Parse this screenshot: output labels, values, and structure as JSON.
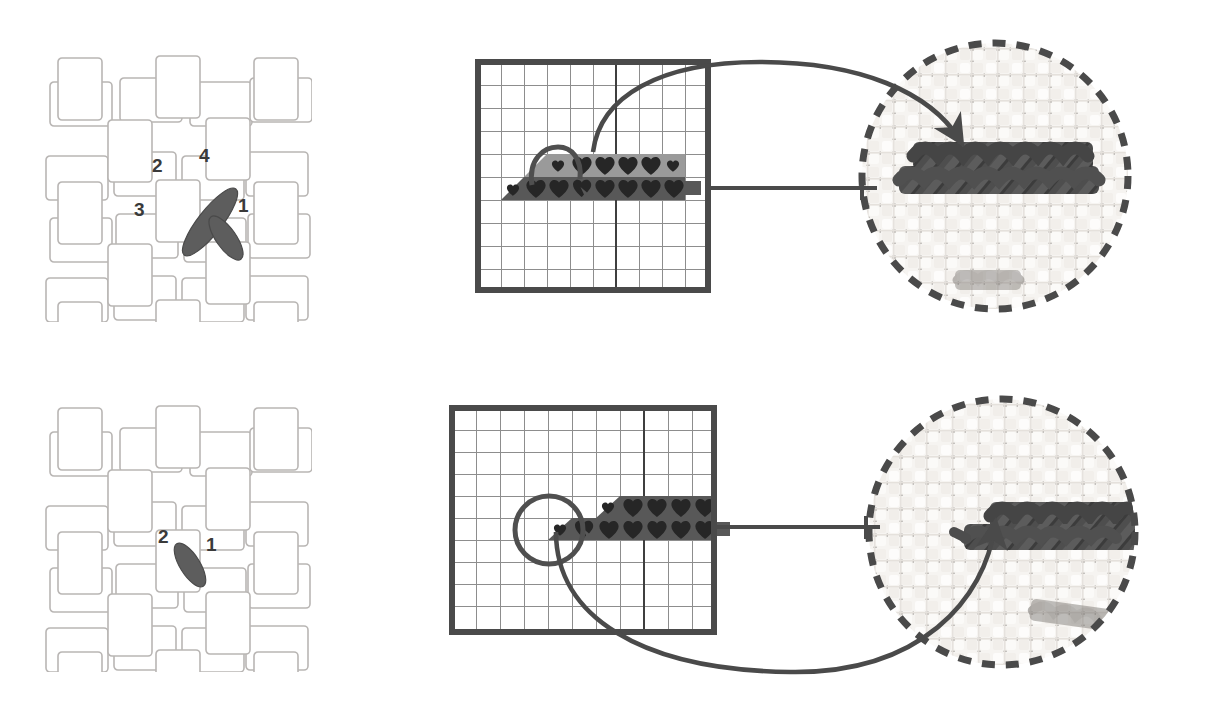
{
  "figure": {
    "background_color": "#ffffff",
    "ink_color": "#4a4a4a",
    "dark_fill": "#555555",
    "light_fill": "#9a9a9a",
    "symbol_color": "#2b2b2b"
  },
  "panels": [
    {
      "id": "full-cross-stitch",
      "row": "top",
      "weave_diagram": {
        "name": "full-cross-stitch-weave",
        "stitch_type": "full cross stitch",
        "needle_points": 4,
        "labels": [
          {
            "text": "1",
            "x": 198,
            "y": 198
          },
          {
            "text": "2",
            "x": 152,
            "y": 163
          },
          {
            "text": "3",
            "x": 138,
            "y": 205
          },
          {
            "text": "4",
            "x": 196,
            "y": 150
          }
        ],
        "strokes": [
          {
            "from": "3",
            "to": "4",
            "kind": "long-diagonal"
          },
          {
            "from": "1",
            "to": "2",
            "kind": "short-diagonal"
          }
        ]
      },
      "chart": {
        "name": "full-cross-stitch-chart",
        "columns": 10,
        "rows": 10,
        "heavy_vertical_gridline_column": 6,
        "band_rows": [
          {
            "row_index": 4,
            "fill": "light",
            "left_ramp": true,
            "right_ramp": true,
            "start_col": 2,
            "end_col": 9,
            "symbols": [
              "half",
              "full",
              "full",
              "full",
              "full",
              "half"
            ],
            "symbol_start_col": 3
          },
          {
            "row_index": 5,
            "fill": "dark",
            "left_ramp": true,
            "right_ramp": false,
            "start_col": 1,
            "end_col": 9,
            "symbols": [
              "half",
              "full",
              "full",
              "partial",
              "full",
              "full",
              "full"
            ],
            "symbol_start_col": 2
          }
        ],
        "thread_tail": {
          "side": "right",
          "row_index": 5
        },
        "working_loop": {
          "center_col": 3.6,
          "center_row": 4.2
        }
      },
      "photo": {
        "name": "full-cross-stitch-photo",
        "subject": "aida cloth with dark floss cross stitches",
        "border_style": "dashed-circle",
        "callout_arrow": {
          "direction": "incoming",
          "from": "chart",
          "to": "photo"
        }
      }
    },
    {
      "id": "half-cross-stitch",
      "row": "bottom",
      "weave_diagram": {
        "name": "half-cross-stitch-weave",
        "stitch_type": "half cross stitch",
        "needle_points": 2,
        "labels": [
          {
            "text": "1",
            "x": 200,
            "y": 197
          },
          {
            "text": "2",
            "x": 152,
            "y": 180
          }
        ],
        "strokes": [
          {
            "from": "2",
            "to": "1",
            "kind": "short-diagonal"
          }
        ]
      },
      "chart": {
        "name": "half-cross-stitch-chart",
        "columns": 11,
        "rows": 10,
        "heavy_vertical_gridline_column": 7,
        "band_rows": [
          {
            "row_index": 4,
            "fill": "dark",
            "left_ramp": true,
            "right_ramp": false,
            "start_col": 4,
            "end_col": 11,
            "symbols": [
              "half",
              "full",
              "full",
              "full"
            ],
            "symbol_start_col": 5
          },
          {
            "row_index": 5,
            "fill": "dark",
            "left_ramp": true,
            "right_ramp": false,
            "start_col": 2,
            "end_col": 11,
            "symbols": [
              "half",
              "partial",
              "full",
              "full",
              "full",
              "full"
            ],
            "symbol_start_col": 3
          }
        ],
        "thread_tail": {
          "side": "right",
          "row_index": 5
        },
        "working_loop": {
          "center_col": 2.6,
          "center_row": 5.0
        }
      },
      "photo": {
        "name": "half-cross-stitch-photo",
        "subject": "aida cloth with dark floss half cross stitches",
        "border_style": "dashed-circle",
        "callout_arrow": {
          "direction": "incoming",
          "from": "chart",
          "to": "photo"
        }
      }
    }
  ]
}
